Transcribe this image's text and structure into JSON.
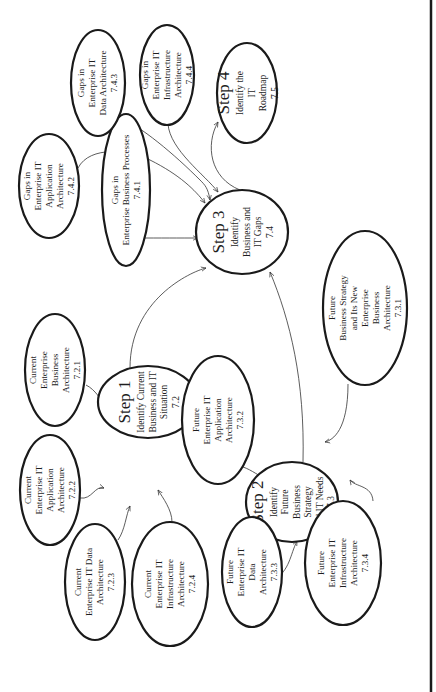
{
  "diagram": {
    "orientation": "rotated-90-ccw",
    "nodes": [
      {
        "id": "step1",
        "title": "Step 1",
        "lines": [
          "Identify Current",
          "Business and IT",
          "Situation",
          "7.2"
        ],
        "cx": 148,
        "cy": 402,
        "rx": 50,
        "ry": 36,
        "kind": "step"
      },
      {
        "id": "step2",
        "title": "Step 2",
        "lines": [
          "Identify",
          "Future",
          "Business",
          "Strategy",
          "and IT Needs",
          "7.3"
        ],
        "cx": 292,
        "cy": 502,
        "rx": 46,
        "ry": 40,
        "kind": "step"
      },
      {
        "id": "step3",
        "title": "Step 3",
        "lines": [
          "Identify",
          "Business and",
          "IT Gaps",
          "7.4"
        ],
        "cx": 242,
        "cy": 232,
        "rx": 46,
        "ry": 42,
        "kind": "step"
      },
      {
        "id": "step4",
        "title": "Step 4",
        "lines": [
          "Identify the",
          "IT",
          "Roadmap",
          "7.5"
        ],
        "cx": 247,
        "cy": 93,
        "rx": 30,
        "ry": 50,
        "kind": "step"
      },
      {
        "id": "n721",
        "title": "",
        "lines": [
          "Current",
          "Enterprise",
          "Business",
          "Architecture",
          "7.2.1"
        ],
        "cx": 55,
        "cy": 370,
        "rx": 30,
        "ry": 56,
        "kind": "leaf"
      },
      {
        "id": "n722",
        "title": "",
        "lines": [
          "Current",
          "Enterprise IT",
          "Application",
          "Architecture",
          "7.2.2"
        ],
        "cx": 50,
        "cy": 490,
        "rx": 30,
        "ry": 55,
        "kind": "leaf"
      },
      {
        "id": "n723",
        "title": "",
        "lines": [
          "Current",
          "Enterprise IT Data",
          "Architecture",
          "7.2.3"
        ],
        "cx": 95,
        "cy": 582,
        "rx": 30,
        "ry": 58,
        "kind": "leaf"
      },
      {
        "id": "n724",
        "title": "",
        "lines": [
          "Current",
          "Enterprise IT",
          "Infrastructure",
          "Architecture",
          "7.2.4"
        ],
        "cx": 170,
        "cy": 584,
        "rx": 38,
        "ry": 62,
        "kind": "leaf"
      },
      {
        "id": "n731",
        "title": "",
        "lines": [
          "Future",
          "Business Strategy",
          "and Its New",
          "Enterprise",
          "Business",
          "Architecture",
          "7.3.1"
        ],
        "cx": 365,
        "cy": 308,
        "rx": 42,
        "ry": 77,
        "kind": "leaf"
      },
      {
        "id": "n732",
        "title": "",
        "lines": [
          "Future",
          "Enterprise IT",
          "Application",
          "Architecture",
          "7.3.2"
        ],
        "cx": 218,
        "cy": 420,
        "rx": 36,
        "ry": 64,
        "kind": "leaf"
      },
      {
        "id": "n733",
        "title": "",
        "lines": [
          "Future",
          "Enterprise IT",
          "Data",
          "Architecture",
          "7.3.3"
        ],
        "cx": 252,
        "cy": 572,
        "rx": 30,
        "ry": 55,
        "kind": "leaf"
      },
      {
        "id": "n734",
        "title": "",
        "lines": [
          "Future",
          "Enterprise IT",
          "Infrastructure",
          "Architecture",
          "7.3.4"
        ],
        "cx": 343,
        "cy": 563,
        "rx": 38,
        "ry": 62,
        "kind": "leaf"
      },
      {
        "id": "n741",
        "title": "",
        "lines": [
          "Gaps in",
          "Enterprise Business Processes",
          "7.4.1"
        ],
        "cx": 126,
        "cy": 190,
        "rx": 24,
        "ry": 76,
        "kind": "leaf"
      },
      {
        "id": "n742",
        "title": "",
        "lines": [
          "Gaps in",
          "Enterprise IT",
          "Application",
          "Architecture",
          "7.4.2"
        ],
        "cx": 49,
        "cy": 186,
        "rx": 30,
        "ry": 52,
        "kind": "leaf"
      },
      {
        "id": "n743",
        "title": "",
        "lines": [
          "Gaps in",
          "Enterprise IT",
          "Data Architecture",
          "7.4.3"
        ],
        "cx": 98,
        "cy": 83,
        "rx": 27,
        "ry": 53,
        "kind": "leaf"
      },
      {
        "id": "n744",
        "title": "",
        "lines": [
          "Gaps in",
          "Enterprise IT",
          "Infrastructure",
          "Architecture",
          "7.4.4"
        ],
        "cx": 167,
        "cy": 75,
        "rx": 27,
        "ry": 50,
        "kind": "leaf"
      }
    ],
    "edges": [
      {
        "from": "n721",
        "to": "step1",
        "d": "M 86 385 C 96 390, 100 400, 105 403"
      },
      {
        "from": "n722",
        "to": "step1",
        "d": "M 80 498 C 92 500, 95 485, 104 488"
      },
      {
        "from": "n723",
        "to": "step1",
        "d": "M 118 540 C 125 530, 126 515, 130 506"
      },
      {
        "from": "n724",
        "to": "step1",
        "d": "M 172 522 C 172 510, 163 498, 158 490"
      },
      {
        "from": "step1",
        "to": "step3",
        "d": "M 130 368 C 130 300, 190 272, 206 268"
      },
      {
        "from": "n731",
        "to": "step2",
        "d": "M 348 384 C 348 430, 333 440, 325 442"
      },
      {
        "from": "n732",
        "to": "step2",
        "d": "M 243 467 C 252 470, 260 477, 265 478"
      },
      {
        "from": "n733",
        "to": "step2",
        "d": "M 274 580 C 290 570, 290 555, 297 541"
      },
      {
        "from": "n734",
        "to": "step2",
        "d": "M 373 501 C 372 485, 355 487, 350 480"
      },
      {
        "from": "step2",
        "to": "step3",
        "d": "M 303 462 C 305 380, 290 320, 270 272"
      },
      {
        "from": "n741",
        "to": "step3",
        "d": "M 136 238 C 160 238, 180 238, 198 238"
      },
      {
        "from": "n742",
        "to": "step3",
        "d": "M 78 168 C 90 145, 130 150, 150 160 C 180 175, 195 190, 205 203"
      },
      {
        "from": "n743",
        "to": "step3",
        "d": "M 118 117 C 140 125, 175 155, 200 180 C 205 185, 208 188, 210 200"
      },
      {
        "from": "n744",
        "to": "step3",
        "d": "M 168 124 C 170 150, 205 175, 218 192"
      },
      {
        "from": "step3",
        "to": "step4",
        "d": "M 240 190 C 210 178, 205 145, 218 122"
      }
    ]
  }
}
